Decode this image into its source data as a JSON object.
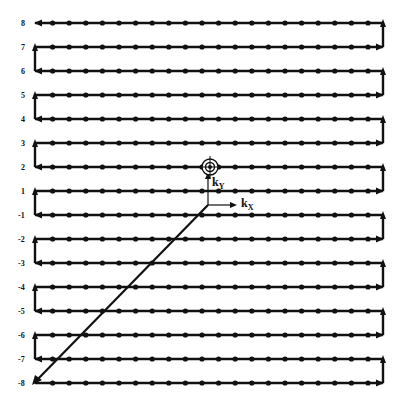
{
  "diagram": {
    "title": "",
    "row_labels": [
      "8",
      "7",
      "6",
      "5",
      "4",
      "3",
      "2",
      "1",
      "-1",
      "-2",
      "-3",
      "-4",
      "-5",
      "-6",
      "-7",
      "-8"
    ],
    "row_values": [
      8,
      7,
      6,
      5,
      4,
      3,
      2,
      1,
      -1,
      -2,
      -3,
      -4,
      -5,
      -6,
      -7,
      -8
    ],
    "samples_per_row": 21,
    "axis_labels": {
      "kx": "k",
      "kx_sub": "X",
      "ky": "k",
      "ky_sub": "Y"
    },
    "center_marker": "k-space-center-target-icon",
    "traversal": "start at center, diagonal to row -8 left end, then raster: rows sweep alternately right/left moving upward, ending at row 8 left end",
    "colors": {
      "line": "#111111",
      "background": "#ffffff"
    }
  }
}
